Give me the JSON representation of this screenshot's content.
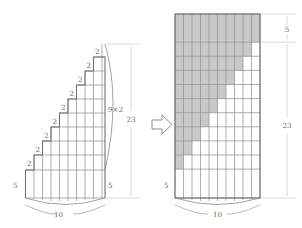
{
  "figure": {
    "transform_arrow": "rightwards-open-arrow",
    "colors": {
      "grid_line": "#8a8a8a",
      "outline": "#6f6f6f",
      "shade_fill": "#c9c9c9",
      "dimension_line": "#b4b4b4",
      "label_text": "#6e6e6e",
      "background": "#ffffff"
    },
    "left_panel": {
      "name": "staircase-shape",
      "columns": 10,
      "rows": 10,
      "base_height_label": "5",
      "right_height_label": "5",
      "width_label": "10",
      "step_labels": [
        "2",
        "2",
        "2",
        "2",
        "2",
        "2",
        "2",
        "2",
        "2"
      ],
      "step_count": 9,
      "total_height_label": "23",
      "stack_label": "9×2",
      "stack_label_plain": "9x2"
    },
    "right_panel": {
      "name": "rectangle-shape",
      "columns": 10,
      "rows": 10,
      "base_height_label": "5",
      "top_band_label": "5",
      "width_label": "10",
      "total_height_label": "23",
      "shaded_rows_from_top": [
        10,
        10,
        9,
        8,
        7,
        6,
        5,
        4,
        3,
        2,
        1
      ],
      "shade_description": "solid top band plus descending staircase of shaded cells"
    },
    "dimensions": {
      "top_segment": "5",
      "full_segment": "23",
      "bottom_width": "10"
    }
  }
}
